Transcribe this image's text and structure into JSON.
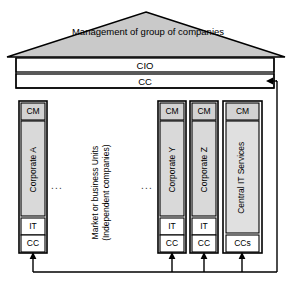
{
  "diagram": {
    "title_roof": "Management of group of companies",
    "roof": {
      "label": "Management of group of companies",
      "fill": "#c9c9c9",
      "stroke": "#000000"
    },
    "header_bars": [
      {
        "label": "CIO",
        "fill": "#ffffff"
      },
      {
        "label": "CC",
        "fill": "#ffffff"
      }
    ],
    "middle_note": "Market or business Units (Independent companies)",
    "middle_note_lines": [
      "Market or",
      "business Units",
      "(Independent",
      "companies)"
    ],
    "ellipsis_left": "...",
    "ellipsis_right": "...",
    "columns": [
      {
        "id": "corporate-a",
        "name": "Corporate A",
        "top_label": "CM",
        "bottom_boxes": [
          "IT",
          "CC"
        ],
        "fill_body": "#d9d9d9",
        "fill_top": "#d2d2d2"
      },
      {
        "id": "corporate-y",
        "name": "Corporate Y",
        "top_label": "CM",
        "bottom_boxes": [
          "IT",
          "CC"
        ],
        "fill_body": "#d9d9d9",
        "fill_top": "#d2d2d2"
      },
      {
        "id": "corporate-z",
        "name": "Corporate Z",
        "top_label": "CM",
        "bottom_boxes": [
          "IT",
          "CC"
        ],
        "fill_body": "#d9d9d9",
        "fill_top": "#d2d2d2"
      },
      {
        "id": "central-it-services",
        "name": "Central IT Services",
        "top_label": "CM",
        "bottom_boxes": [
          "CCs"
        ],
        "fill_body": "#e0e0e0",
        "fill_top": "#d2d2d2"
      }
    ],
    "connectors": {
      "description": "Arrows from each unit CC box down to a shared bus, returning up the right side into the group CC bar",
      "arrow_count_up": 4,
      "feedback_arrow_direction": "left"
    },
    "colors": {
      "stroke": "#000000",
      "gray_roof": "#c9c9c9",
      "gray_box": "#d9d9d9",
      "white": "#ffffff"
    }
  }
}
